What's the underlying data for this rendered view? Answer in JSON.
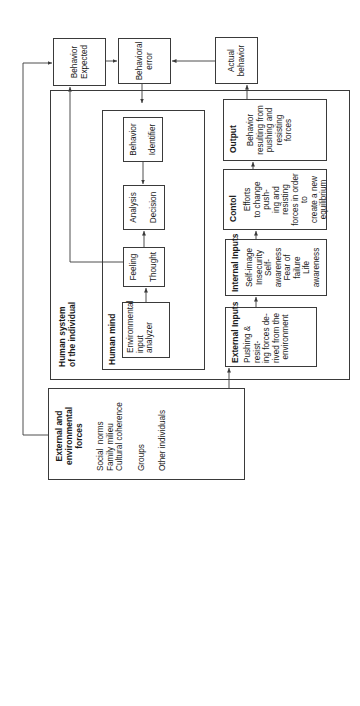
{
  "diagram": {
    "external_forces": {
      "title": "External and environmental forces",
      "items": [
        "Social  norms",
        "Family milieu",
        "Cultural coherence",
        "Groups",
        "Other individuals"
      ]
    },
    "human_system": {
      "title_line1": "Human system",
      "title_line2": "of the individual",
      "human_mind": {
        "title": "Human mind",
        "env_analyzer": [
          "Environmental",
          "input",
          "analyzer"
        ],
        "feeling_thought": [
          "Feeling",
          "Thought"
        ],
        "analysis_decision": [
          "Analysis",
          "Decision"
        ],
        "behavior_identifier": [
          "Behavior",
          "Identifier"
        ]
      },
      "external_inputs": {
        "title": "External Inputs",
        "body": [
          "Pushing & resist-",
          "ing forces de-",
          "rived from the",
          "environment"
        ]
      },
      "internal_inputs": {
        "title": "Internal Inputs",
        "body": [
          "Self-image",
          "Insecurity",
          "Self-awareness",
          "Fear of failure",
          "Life awareness"
        ]
      },
      "control": {
        "title": "Contol",
        "body": [
          "Efforts",
          "to change push-",
          "ing and resisting",
          "forces in order to",
          "create a new",
          "equilibrium"
        ]
      },
      "output": {
        "title": "Output",
        "body": [
          "Behavior",
          "resulting from",
          "pushing and",
          "resisting forces"
        ]
      }
    },
    "behavior_expected": [
      "Behavior",
      "Expected"
    ],
    "behavioral_error": [
      "Behavioral",
      "error"
    ],
    "actual_behavior": [
      "Actual",
      "behavior"
    ]
  }
}
